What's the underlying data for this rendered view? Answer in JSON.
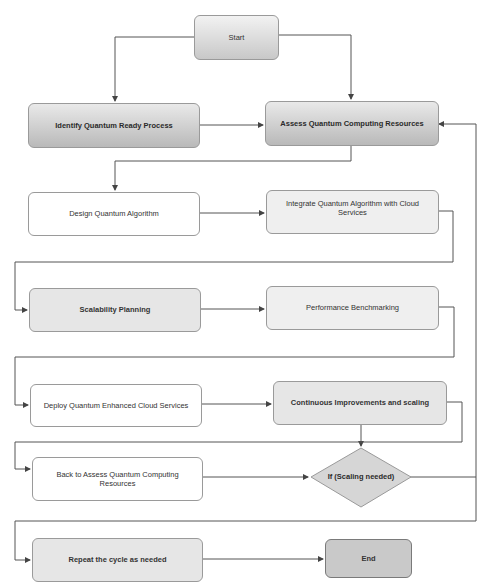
{
  "diagram": {
    "type": "flowchart",
    "nodes": {
      "start": {
        "label": "Start"
      },
      "identify": {
        "label": "Identify Quantum Ready Process"
      },
      "assess": {
        "label": "Assess Quantum Computing Resources"
      },
      "design": {
        "label": "Design Quantum Algorithm"
      },
      "integrate": {
        "label": "Integrate Quantum Algorithm with Cloud Services"
      },
      "scalability": {
        "label": "Scalability Planning"
      },
      "performance": {
        "label": "Performance Benchmarking"
      },
      "deploy": {
        "label": "Deploy Quantum Enhanced Cloud Services"
      },
      "continuous": {
        "label": "Continuous Improvements and scaling"
      },
      "back": {
        "label": "Back to Assess Quantum Computing Resources"
      },
      "decision": {
        "label": "If (Scaling needed)"
      },
      "repeat": {
        "label": "Repeat the cycle as needed"
      },
      "end": {
        "label": "End"
      }
    },
    "edges": [
      {
        "from": "Start",
        "to": "Identify Quantum Ready Process"
      },
      {
        "from": "Start",
        "to": "Assess Quantum Computing Resources"
      },
      {
        "from": "Identify Quantum Ready Process",
        "to": "Assess Quantum Computing Resources"
      },
      {
        "from": "Assess Quantum Computing Resources",
        "to": "Design Quantum Algorithm"
      },
      {
        "from": "Design Quantum Algorithm",
        "to": "Integrate Quantum Algorithm with Cloud Services"
      },
      {
        "from": "Integrate Quantum Algorithm with Cloud Services",
        "to": "Scalability Planning"
      },
      {
        "from": "Scalability Planning",
        "to": "Performance Benchmarking"
      },
      {
        "from": "Performance Benchmarking",
        "to": "Deploy Quantum Enhanced Cloud Services"
      },
      {
        "from": "Deploy Quantum Enhanced Cloud Services",
        "to": "Continuous Improvements and scaling"
      },
      {
        "from": "Continuous Improvements and scaling",
        "to": "If (Scaling needed)"
      },
      {
        "from": "Continuous Improvements and scaling",
        "to": "Back to Assess Quantum Computing Resources"
      },
      {
        "from": "Back to Assess Quantum Computing Resources",
        "to": "If (Scaling needed)"
      },
      {
        "from": "If (Scaling needed)",
        "to": "Assess Quantum Computing Resources"
      },
      {
        "from": "If (Scaling needed)",
        "to": "Repeat the cycle as needed"
      },
      {
        "from": "Repeat the cycle as needed",
        "to": "End"
      }
    ],
    "colors": {
      "line": "#555555",
      "node_border": "#9a9a9a",
      "end_fill": "#c9c9c9",
      "decision_fill": "#d6d6d6"
    }
  }
}
